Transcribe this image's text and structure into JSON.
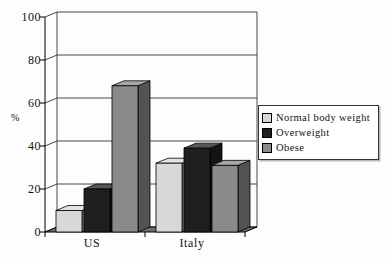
{
  "canvas": {
    "width": 386,
    "height": 263,
    "background": "#fdfdfd"
  },
  "chart_data": {
    "type": "bar",
    "style": "3d-clustered-column",
    "title": "",
    "xlabel": "",
    "ylabel": "%",
    "ylim": [
      0,
      100
    ],
    "ytick_step": 20,
    "ytick_labels": [
      "0",
      "20",
      "40",
      "60",
      "80",
      "100"
    ],
    "grid": true,
    "legend_position": "right",
    "categories": [
      "US",
      "Italy"
    ],
    "series": [
      {
        "name": "Normal body weight",
        "values": [
          10,
          32
        ],
        "color": "#d8d8d8"
      },
      {
        "name": "Overweight",
        "values": [
          20,
          39
        ],
        "color": "#1f1f1f"
      },
      {
        "name": "Obese",
        "values": [
          68,
          31
        ],
        "color": "#8a8a8a"
      }
    ]
  },
  "colors": {
    "floor": "#6e6e6e",
    "gridline": "#333333",
    "axis": "#000000",
    "wall_edge": "#333333",
    "legend_border": "#333333",
    "text": "#111111"
  }
}
